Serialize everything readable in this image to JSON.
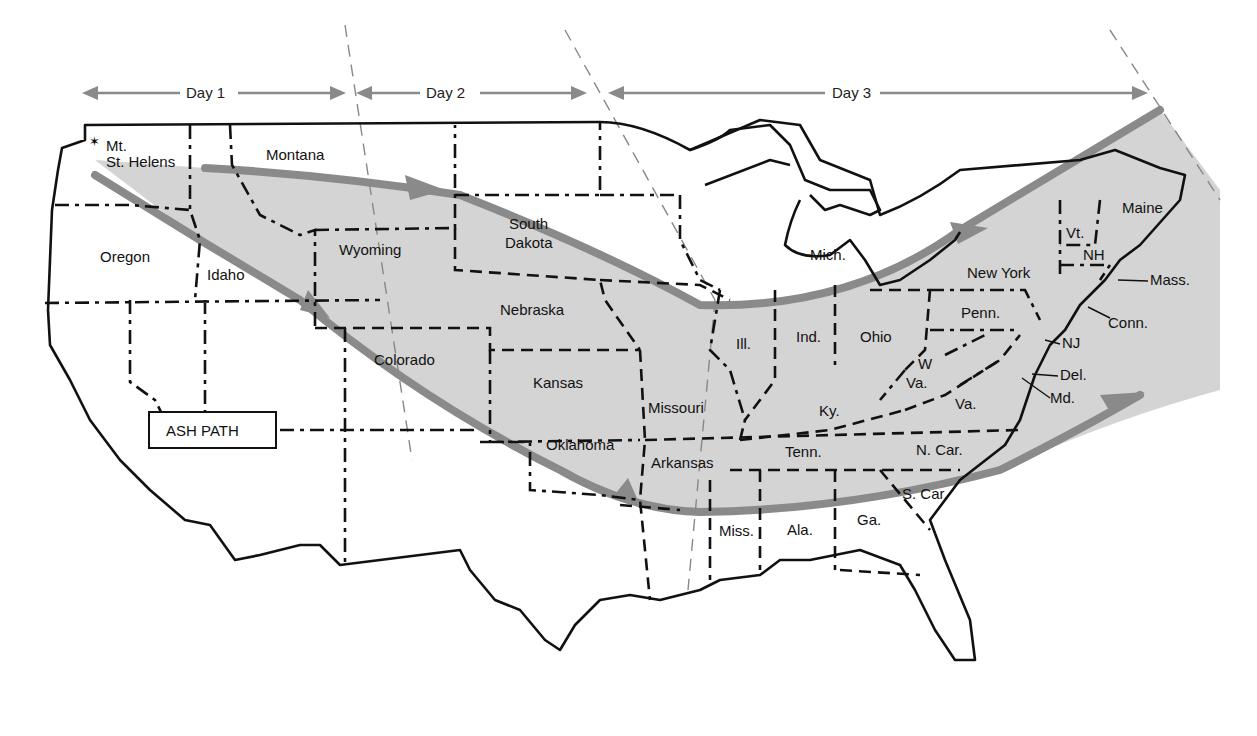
{
  "title_box": {
    "label": "ASH PATH"
  },
  "origin": {
    "label_line1": "Mt.",
    "label_line2": "St. Helens",
    "icon": "star-icon"
  },
  "day_spans": [
    {
      "label": "Day 1"
    },
    {
      "label": "Day 2"
    },
    {
      "label": "Day 3"
    }
  ],
  "colors": {
    "ash_band": "#d2d2d2",
    "ash_edge": "#8a8a8a",
    "borders": "#111111"
  },
  "states": {
    "montana": "Montana",
    "oregon": "Oregon",
    "idaho": "Idaho",
    "wyoming": "Wyoming",
    "south_dakota_1": "South",
    "south_dakota_2": "Dakota",
    "nebraska": "Nebraska",
    "colorado": "Colorado",
    "kansas": "Kansas",
    "oklahoma": "Oklahoma",
    "missouri": "Missouri",
    "arkansas": "Arkansas",
    "michigan": "Mich.",
    "illinois": "Ill.",
    "indiana": "Ind.",
    "ohio": "Ohio",
    "kentucky": "Ky.",
    "tennessee": "Tenn.",
    "west_virginia_1": "W",
    "west_virginia_2": "Va.",
    "virginia": "Va.",
    "north_carolina": "N. Car.",
    "south_carolina": "S. Car.",
    "georgia": "Ga.",
    "alabama": "Ala.",
    "mississippi": "Miss.",
    "pennsylvania": "Penn.",
    "new_york": "New York",
    "vermont": "Vt.",
    "new_hampshire": "NH",
    "maine": "Maine",
    "massachusetts": "Mass.",
    "connecticut": "Conn.",
    "new_jersey": "NJ",
    "delaware": "Del.",
    "maryland": "Md."
  }
}
